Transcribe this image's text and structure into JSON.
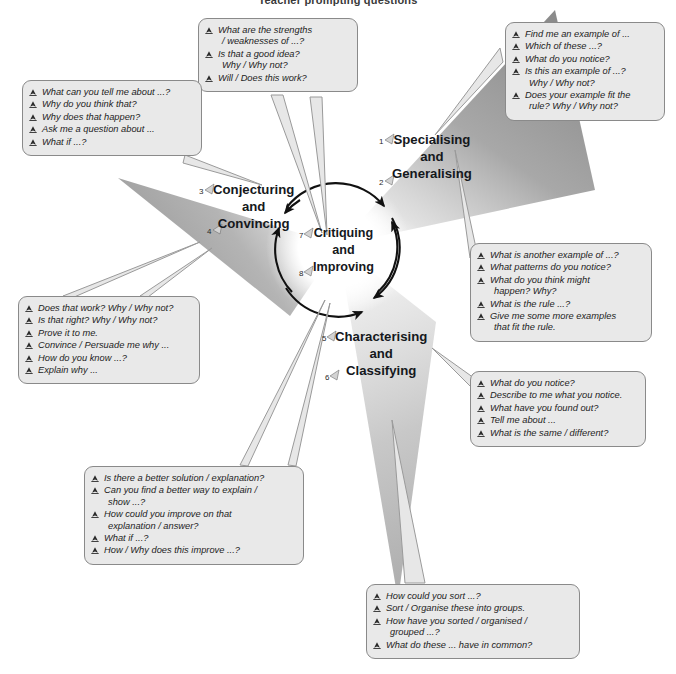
{
  "title": "Teacher prompting questions",
  "colors": {
    "triangle_dark": "#8c8c8c",
    "triangle_light": "#d8d8d8",
    "callout_fill": "#e9e9e9",
    "callout_border": "#8a8a8a",
    "text": "#1d1d1d",
    "heading": "#15181c",
    "arrow": "#111111",
    "leader": "#9a9a9a"
  },
  "cycle": {
    "center": {
      "label_lines": [
        "Critiquing",
        "and",
        "Improving"
      ],
      "numbers": [
        "7",
        "8"
      ]
    },
    "nodes": [
      {
        "id": "specialising-generalising",
        "label_lines": [
          "Specialising",
          "and",
          "Generalising"
        ],
        "numbers": [
          "1",
          "2"
        ]
      },
      {
        "id": "conjecturing-convincing",
        "label_lines": [
          "Conjecturing",
          "and",
          "Convincing"
        ],
        "numbers": [
          "3",
          "4"
        ]
      },
      {
        "id": "characterising-classifying",
        "label_lines": [
          "Characterising",
          "and",
          "Classifying"
        ],
        "numbers": [
          "5",
          "6"
        ]
      }
    ]
  },
  "callouts": {
    "top_center": {
      "name": "critiquing-improving-top",
      "items": [
        {
          "text": "What are the strengths",
          "cont": "/ weaknesses of ...?"
        },
        {
          "text": "Is that a good idea?",
          "cont": "Why / Why not?"
        },
        {
          "text": "Will / Does this work?",
          "cont": ""
        }
      ]
    },
    "top_left": {
      "name": "conjecturing-convincing-upper",
      "items": [
        {
          "text": "What can you tell me about ...?",
          "cont": ""
        },
        {
          "text": "Why do you think that?",
          "cont": ""
        },
        {
          "text": "Why does that happen?",
          "cont": ""
        },
        {
          "text": "Ask me a question about ...",
          "cont": ""
        },
        {
          "text": "What if ...?",
          "cont": ""
        }
      ]
    },
    "top_right": {
      "name": "specialising-upper",
      "items": [
        {
          "text": "Find me an example of ...",
          "cont": ""
        },
        {
          "text": "Which of these ...?",
          "cont": ""
        },
        {
          "text": "What do you notice?",
          "cont": ""
        },
        {
          "text": "Is this an example of ...?",
          "cont": "Why / Why not?"
        },
        {
          "text": "Does your example fit the",
          "cont": "rule? Why / Why not?"
        }
      ]
    },
    "right_middle": {
      "name": "generalising-questions",
      "items": [
        {
          "text": "What is another example of ...?",
          "cont": ""
        },
        {
          "text": "What patterns do you notice?",
          "cont": ""
        },
        {
          "text": "What do you think might",
          "cont": "happen? Why?"
        },
        {
          "text": "What is the rule ...?",
          "cont": ""
        },
        {
          "text": "Give me some more examples",
          "cont": "that fit the rule."
        }
      ]
    },
    "right_lower": {
      "name": "characterising-questions",
      "items": [
        {
          "text": "What do you notice?",
          "cont": ""
        },
        {
          "text": "Describe to me what you notice.",
          "cont": ""
        },
        {
          "text": "What have you found out?",
          "cont": ""
        },
        {
          "text": "Tell me about ...",
          "cont": ""
        },
        {
          "text": "What is the same / different?",
          "cont": ""
        }
      ]
    },
    "left_lower": {
      "name": "convincing-questions",
      "items": [
        {
          "text": "Does that work? Why / Why not?",
          "cont": ""
        },
        {
          "text": "Is that right? Why / Why not?",
          "cont": ""
        },
        {
          "text": "Prove it to me.",
          "cont": ""
        },
        {
          "text": "Convince / Persuade me why ...",
          "cont": ""
        },
        {
          "text": "How do you know ...?",
          "cont": ""
        },
        {
          "text": "Explain why ...",
          "cont": ""
        }
      ]
    },
    "bottom_left": {
      "name": "improving-questions",
      "items": [
        {
          "text": "Is there a better solution / explanation?",
          "cont": ""
        },
        {
          "text": "Can you find a better way to explain /",
          "cont": "show ...?"
        },
        {
          "text": "How could you improve on that",
          "cont": "explanation / answer?"
        },
        {
          "text": "What if ...?",
          "cont": ""
        },
        {
          "text": "How / Why does this improve ...?",
          "cont": ""
        }
      ]
    },
    "bottom_center": {
      "name": "classifying-questions",
      "items": [
        {
          "text": "How could you sort ...?",
          "cont": ""
        },
        {
          "text": "Sort / Organise these into groups.",
          "cont": ""
        },
        {
          "text": "How have you sorted / organised /",
          "cont": "grouped ...?"
        },
        {
          "text": "What do these ... have in common?",
          "cont": ""
        }
      ]
    }
  }
}
